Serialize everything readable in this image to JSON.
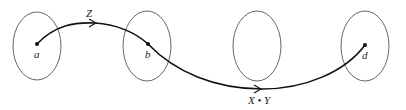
{
  "diagram": {
    "ellipses": [
      {
        "id": "set-1",
        "cx": 37,
        "cy": 46,
        "rx": 24,
        "ry": 34
      },
      {
        "id": "set-2",
        "cx": 147,
        "cy": 46,
        "rx": 24,
        "ry": 35
      },
      {
        "id": "set-3",
        "cx": 257,
        "cy": 46,
        "rx": 24,
        "ry": 35
      },
      {
        "id": "set-4",
        "cx": 365,
        "cy": 46,
        "rx": 24,
        "ry": 35
      }
    ],
    "points": [
      {
        "label": "a",
        "x": 37,
        "y": 44
      },
      {
        "label": "b",
        "x": 148,
        "y": 44
      },
      {
        "label": "d",
        "x": 365,
        "y": 45
      }
    ],
    "paths": [
      {
        "label": "Z",
        "from": "a",
        "to": "b"
      },
      {
        "label": "X • Y",
        "from": "b",
        "to": "d"
      }
    ]
  }
}
